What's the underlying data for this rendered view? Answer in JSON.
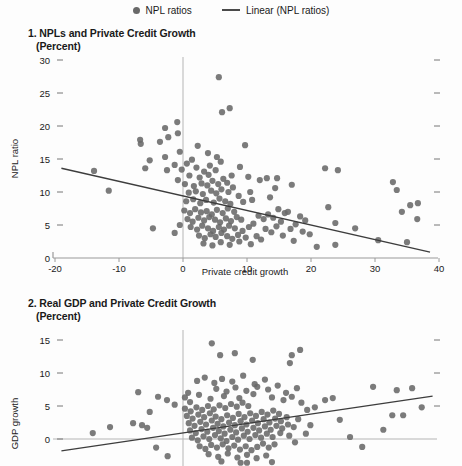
{
  "legend": {
    "items": [
      {
        "label": "NPL ratios",
        "marker": "dot"
      },
      {
        "label": "Linear (NPL ratios)",
        "marker": "line"
      }
    ]
  },
  "colors": {
    "dot": "#696969",
    "trend_line": "#3d3d3d",
    "gridline": "#b5b5b5",
    "axis": "#9a9a9a",
    "tick": "#777777",
    "text": "#1a1a1a"
  },
  "chart_data": [
    {
      "type": "scatter",
      "title": "1. NPLs and Private Credit Growth",
      "subtitle": "(Percent)",
      "xlabel": "Private credit growth",
      "ylabel": "NPL ratio",
      "xlim": [
        -20,
        40
      ],
      "ylim": [
        0,
        30.5
      ],
      "x_ticks": [
        -20,
        -10,
        0,
        10,
        20,
        30,
        40
      ],
      "y_ticks": [
        0,
        5,
        10,
        15,
        20,
        25,
        30
      ],
      "right_ticks": [
        5,
        10,
        15,
        20,
        25,
        30
      ],
      "grid": {
        "vline_x": 0
      },
      "legend_series": "NPL ratios",
      "trend_line": {
        "x1": -19,
        "y1": 13.6,
        "x2": 38.6,
        "y2": 0.9
      },
      "points": [
        [
          -13.9,
          13.2
        ],
        [
          -11.6,
          10.2
        ],
        [
          -6.7,
          17.9
        ],
        [
          -6.6,
          17.3
        ],
        [
          -5.9,
          13.6
        ],
        [
          -5.2,
          14.8
        ],
        [
          -4.7,
          4.5
        ],
        [
          -3.6,
          17.6
        ],
        [
          -2.8,
          19.7
        ],
        [
          -2.8,
          15.3
        ],
        [
          -2.3,
          18.3
        ],
        [
          -2.5,
          13.3
        ],
        [
          -1.3,
          14.1
        ],
        [
          -1.3,
          3.8
        ],
        [
          -0.9,
          20.6
        ],
        [
          -0.8,
          18.9
        ],
        [
          -0.8,
          11.8
        ],
        [
          -0.5,
          16.1
        ],
        [
          -0.5,
          5.0
        ],
        [
          5.6,
          27.4
        ],
        [
          6.1,
          22.1
        ],
        [
          7.3,
          22.7
        ],
        [
          2.3,
          17.0
        ],
        [
          3.9,
          15.9
        ],
        [
          5.3,
          15.3
        ],
        [
          9.7,
          17.1
        ],
        [
          8.9,
          13.8
        ],
        [
          10.2,
          12.3
        ],
        [
          12.0,
          11.8
        ],
        [
          13.1,
          12.1
        ],
        [
          14.7,
          12.1
        ],
        [
          14.4,
          10.6
        ],
        [
          17.0,
          11.1
        ],
        [
          13.6,
          9.2
        ],
        [
          10.5,
          10.0
        ],
        [
          10.8,
          8.8
        ],
        [
          9.4,
          8.5
        ],
        [
          22.2,
          13.6
        ],
        [
          24.2,
          13.3
        ],
        [
          22.7,
          7.7
        ],
        [
          23.8,
          5.3
        ],
        [
          26.9,
          4.5
        ],
        [
          23.8,
          2.0
        ],
        [
          30.5,
          2.7
        ],
        [
          20.9,
          1.7
        ],
        [
          32.8,
          11.5
        ],
        [
          33.4,
          10.3
        ],
        [
          35.5,
          8.0
        ],
        [
          36.7,
          8.3
        ],
        [
          34.2,
          7.0
        ],
        [
          36.6,
          5.9
        ],
        [
          35.0,
          2.4
        ],
        [
          -0.2,
          13.4
        ],
        [
          0.6,
          14.3
        ],
        [
          1.4,
          14.9
        ],
        [
          2.1,
          13.7
        ],
        [
          1.0,
          12.5
        ],
        [
          2.6,
          12.2
        ],
        [
          3.3,
          13.1
        ],
        [
          4.2,
          14.0
        ],
        [
          4.0,
          12.6
        ],
        [
          5.1,
          13.3
        ],
        [
          5.9,
          14.6
        ],
        [
          0.3,
          11.2
        ],
        [
          1.7,
          10.9
        ],
        [
          2.9,
          11.3
        ],
        [
          3.8,
          11.0
        ],
        [
          4.6,
          11.7
        ],
        [
          5.5,
          11.2
        ],
        [
          6.3,
          12.0
        ],
        [
          6.9,
          11.4
        ],
        [
          7.6,
          12.5
        ],
        [
          0.9,
          9.9
        ],
        [
          2.0,
          10.1
        ],
        [
          3.1,
          9.7
        ],
        [
          4.4,
          10.2
        ],
        [
          5.2,
          9.8
        ],
        [
          6.0,
          10.4
        ],
        [
          7.1,
          10.0
        ],
        [
          7.8,
          10.7
        ],
        [
          0.5,
          8.6
        ],
        [
          1.6,
          8.9
        ],
        [
          2.7,
          8.3
        ],
        [
          3.6,
          8.8
        ],
        [
          4.8,
          8.4
        ],
        [
          5.7,
          9.0
        ],
        [
          6.6,
          8.6
        ],
        [
          7.4,
          8.2
        ],
        [
          8.7,
          9.4
        ],
        [
          0.2,
          7.2
        ],
        [
          1.1,
          6.8
        ],
        [
          1.9,
          7.4
        ],
        [
          2.8,
          6.9
        ],
        [
          3.7,
          7.1
        ],
        [
          4.5,
          6.6
        ],
        [
          5.3,
          7.3
        ],
        [
          6.2,
          6.8
        ],
        [
          7.0,
          7.5
        ],
        [
          8.0,
          7.0
        ],
        [
          0.7,
          5.9
        ],
        [
          1.5,
          5.5
        ],
        [
          2.4,
          6.1
        ],
        [
          3.3,
          5.7
        ],
        [
          4.1,
          6.2
        ],
        [
          5.0,
          5.8
        ],
        [
          5.8,
          5.4
        ],
        [
          6.7,
          6.0
        ],
        [
          7.5,
          5.6
        ],
        [
          8.4,
          6.2
        ],
        [
          9.1,
          5.8
        ],
        [
          1.2,
          4.7
        ],
        [
          2.2,
          4.3
        ],
        [
          3.0,
          4.9
        ],
        [
          3.9,
          4.5
        ],
        [
          4.7,
          4.1
        ],
        [
          5.6,
          4.7
        ],
        [
          6.4,
          4.3
        ],
        [
          7.2,
          4.9
        ],
        [
          8.1,
          4.5
        ],
        [
          9.3,
          4.1
        ],
        [
          10.3,
          4.7
        ],
        [
          2.5,
          3.4
        ],
        [
          3.4,
          3.0
        ],
        [
          4.3,
          3.6
        ],
        [
          5.1,
          3.2
        ],
        [
          6.0,
          3.8
        ],
        [
          6.9,
          3.3
        ],
        [
          7.7,
          2.9
        ],
        [
          8.6,
          3.5
        ],
        [
          9.8,
          3.1
        ],
        [
          3.2,
          2.2
        ],
        [
          4.6,
          1.9
        ],
        [
          5.9,
          2.4
        ],
        [
          7.3,
          2.0
        ],
        [
          8.8,
          2.5
        ],
        [
          10.6,
          2.1
        ],
        [
          11.5,
          3.3
        ],
        [
          12.2,
          2.8
        ],
        [
          11.0,
          5.2
        ],
        [
          11.8,
          6.4
        ],
        [
          12.6,
          5.9
        ],
        [
          13.3,
          6.6
        ],
        [
          14.1,
          6.1
        ],
        [
          12.9,
          4.4
        ],
        [
          13.8,
          3.9
        ],
        [
          14.6,
          4.8
        ],
        [
          15.3,
          5.5
        ],
        [
          15.9,
          6.8
        ],
        [
          14.9,
          7.4
        ],
        [
          16.4,
          7.0
        ],
        [
          15.6,
          3.4
        ],
        [
          16.8,
          4.4
        ],
        [
          17.6,
          5.1
        ],
        [
          18.3,
          6.3
        ],
        [
          19.1,
          5.7
        ],
        [
          18.7,
          4.0
        ],
        [
          19.8,
          3.6
        ],
        [
          17.3,
          2.6
        ]
      ]
    },
    {
      "type": "scatter",
      "title": "2. Real GDP and Private Credit Growth",
      "subtitle": "(Percent)",
      "xlabel": "",
      "ylabel": "GDP growth",
      "xlim": [
        -20,
        40
      ],
      "ylim": [
        -4.2,
        16.5
      ],
      "x_ticks": [],
      "y_ticks": [
        0,
        5,
        10,
        15
      ],
      "right_ticks": [
        5,
        10,
        15
      ],
      "grid": {
        "vline_x": 0,
        "hline_y": 0
      },
      "legend_series": "GDP growth",
      "trend_line": {
        "x1": -19,
        "y1": -1.8,
        "x2": 39,
        "y2": 6.5
      },
      "points": [
        [
          4.5,
          14.5
        ],
        [
          5.8,
          12.7
        ],
        [
          8.1,
          13.0
        ],
        [
          17.0,
          12.7
        ],
        [
          18.3,
          13.5
        ],
        [
          16.7,
          11.5
        ],
        [
          10.9,
          12.0
        ],
        [
          0.8,
          7.0
        ],
        [
          1.1,
          5.6
        ],
        [
          -7.0,
          7.1
        ],
        [
          -5.2,
          4.1
        ],
        [
          -3.9,
          6.4
        ],
        [
          -2.5,
          5.9
        ],
        [
          -1.3,
          5.2
        ],
        [
          -7.8,
          2.4
        ],
        [
          -6.4,
          2.1
        ],
        [
          -5.6,
          1.7
        ],
        [
          -14.1,
          0.9
        ],
        [
          -11.4,
          1.8
        ],
        [
          -4.2,
          -1.3
        ],
        [
          -2.4,
          -2.6
        ],
        [
          29.7,
          7.9
        ],
        [
          33.4,
          7.4
        ],
        [
          35.8,
          7.7
        ],
        [
          32.7,
          3.6
        ],
        [
          34.4,
          3.6
        ],
        [
          37.3,
          4.8
        ],
        [
          31.3,
          1.4
        ],
        [
          26.1,
          0.3
        ],
        [
          28.0,
          -1.2
        ],
        [
          24.5,
          2.9
        ],
        [
          22.2,
          5.9
        ],
        [
          23.4,
          6.2
        ],
        [
          20.6,
          4.8
        ],
        [
          10.0,
          -3.6
        ],
        [
          13.9,
          -3.5
        ],
        [
          2.2,
          8.8
        ],
        [
          3.4,
          9.3
        ],
        [
          4.9,
          8.5
        ],
        [
          6.1,
          9.1
        ],
        [
          7.7,
          8.7
        ],
        [
          9.4,
          9.6
        ],
        [
          11.2,
          8.3
        ],
        [
          12.8,
          9.0
        ],
        [
          5.2,
          7.6
        ],
        [
          6.8,
          7.2
        ],
        [
          8.2,
          7.8
        ],
        [
          9.9,
          7.3
        ],
        [
          11.6,
          7.9
        ],
        [
          13.3,
          7.5
        ],
        [
          14.8,
          8.1
        ],
        [
          16.1,
          7.0
        ],
        [
          17.8,
          7.7
        ],
        [
          0.3,
          6.3
        ],
        [
          2.5,
          6.7
        ],
        [
          4.3,
          6.1
        ],
        [
          6.4,
          6.5
        ],
        [
          8.8,
          6.2
        ],
        [
          11.0,
          6.8
        ],
        [
          13.9,
          6.3
        ],
        [
          15.7,
          5.9
        ],
        [
          17.0,
          6.4
        ],
        [
          18.5,
          5.5
        ],
        [
          19.4,
          4.4
        ],
        [
          18.0,
          3.0
        ],
        [
          19.9,
          2.1
        ],
        [
          17.5,
          -0.5
        ],
        [
          19.2,
          0.8
        ],
        [
          0.3,
          4.6
        ],
        [
          1.2,
          4.2
        ],
        [
          2.1,
          4.8
        ],
        [
          3.0,
          4.4
        ],
        [
          3.9,
          5.0
        ],
        [
          4.8,
          4.5
        ],
        [
          5.7,
          5.1
        ],
        [
          6.6,
          4.7
        ],
        [
          7.5,
          5.3
        ],
        [
          8.4,
          4.9
        ],
        [
          9.3,
          5.5
        ],
        [
          10.2,
          5.0
        ],
        [
          0.6,
          3.5
        ],
        [
          1.5,
          3.1
        ],
        [
          2.4,
          3.7
        ],
        [
          3.3,
          3.3
        ],
        [
          4.2,
          3.9
        ],
        [
          5.1,
          3.4
        ],
        [
          6.0,
          3.0
        ],
        [
          6.9,
          3.6
        ],
        [
          7.8,
          3.2
        ],
        [
          8.7,
          3.8
        ],
        [
          9.6,
          3.3
        ],
        [
          10.5,
          3.9
        ],
        [
          11.4,
          3.5
        ],
        [
          12.3,
          4.1
        ],
        [
          13.2,
          3.7
        ],
        [
          14.1,
          4.3
        ],
        [
          15.0,
          3.8
        ],
        [
          0.9,
          2.4
        ],
        [
          1.8,
          2.0
        ],
        [
          2.7,
          2.6
        ],
        [
          3.6,
          2.2
        ],
        [
          4.5,
          2.8
        ],
        [
          5.4,
          2.3
        ],
        [
          6.3,
          1.9
        ],
        [
          7.2,
          2.5
        ],
        [
          8.1,
          2.1
        ],
        [
          9.0,
          2.7
        ],
        [
          9.9,
          2.2
        ],
        [
          10.8,
          2.8
        ],
        [
          11.7,
          2.4
        ],
        [
          12.6,
          3.0
        ],
        [
          13.5,
          2.5
        ],
        [
          14.4,
          3.1
        ],
        [
          15.3,
          2.7
        ],
        [
          16.2,
          3.3
        ],
        [
          1.1,
          1.3
        ],
        [
          2.0,
          0.9
        ],
        [
          2.9,
          1.5
        ],
        [
          3.8,
          1.1
        ],
        [
          4.7,
          1.7
        ],
        [
          5.6,
          1.2
        ],
        [
          6.5,
          0.8
        ],
        [
          7.4,
          1.4
        ],
        [
          8.3,
          1.0
        ],
        [
          9.2,
          1.6
        ],
        [
          10.1,
          1.1
        ],
        [
          11.0,
          1.7
        ],
        [
          11.9,
          1.3
        ],
        [
          12.8,
          1.9
        ],
        [
          13.7,
          1.4
        ],
        [
          14.6,
          2.0
        ],
        [
          15.5,
          1.6
        ],
        [
          16.4,
          2.2
        ],
        [
          17.3,
          1.8
        ],
        [
          1.4,
          0.2
        ],
        [
          2.3,
          -0.2
        ],
        [
          3.2,
          0.4
        ],
        [
          4.1,
          0.0
        ],
        [
          5.0,
          0.6
        ],
        [
          5.9,
          0.1
        ],
        [
          6.8,
          -0.3
        ],
        [
          7.7,
          0.3
        ],
        [
          8.6,
          -0.1
        ],
        [
          9.5,
          0.5
        ],
        [
          10.4,
          0.0
        ],
        [
          11.3,
          0.6
        ],
        [
          12.2,
          0.2
        ],
        [
          13.1,
          0.8
        ],
        [
          14.0,
          0.3
        ],
        [
          15.2,
          0.9
        ],
        [
          16.6,
          0.5
        ],
        [
          2.6,
          -1.1
        ],
        [
          3.5,
          -1.5
        ],
        [
          4.4,
          -0.9
        ],
        [
          5.3,
          -1.3
        ],
        [
          6.2,
          -0.8
        ],
        [
          7.1,
          -1.4
        ],
        [
          8.0,
          -1.0
        ],
        [
          8.9,
          -1.6
        ],
        [
          9.8,
          -1.1
        ],
        [
          10.7,
          -1.7
        ],
        [
          11.6,
          -1.2
        ],
        [
          12.5,
          -0.7
        ],
        [
          13.4,
          -1.3
        ],
        [
          14.3,
          -0.8
        ],
        [
          4.0,
          -2.3
        ],
        [
          5.5,
          -2.7
        ],
        [
          7.0,
          -2.2
        ],
        [
          8.5,
          -2.8
        ],
        [
          10.0,
          -2.4
        ],
        [
          11.5,
          -2.9
        ],
        [
          13.0,
          -2.5
        ],
        [
          6.0,
          -3.4
        ],
        [
          9.0,
          -3.6
        ]
      ]
    }
  ]
}
